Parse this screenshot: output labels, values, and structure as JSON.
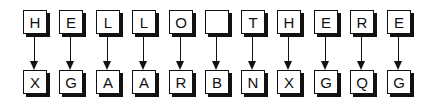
{
  "diagram": {
    "type": "letter-substitution-mapping",
    "plaintext": [
      "H",
      "E",
      "L",
      "L",
      "O",
      " ",
      "T",
      "H",
      "E",
      "R",
      "E"
    ],
    "ciphertext": [
      "X",
      "G",
      "A",
      "A",
      "R",
      "B",
      "N",
      "X",
      "G",
      "Q",
      "G"
    ],
    "plaintext_string": "HELLO THERE",
    "ciphertext_string": "XGAARBNXGQG",
    "colors": {
      "stroke": "#111111",
      "fill": "#ffffff",
      "shadow": "#111111"
    }
  }
}
